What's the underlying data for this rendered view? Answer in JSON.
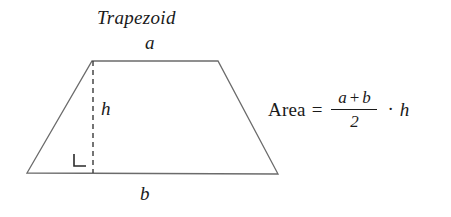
{
  "figure": {
    "title": "Trapezoid",
    "type": "geometry-diagram",
    "background_color": "#ffffff",
    "stroke_color": "#6b6b6b",
    "text_color": "#1a1a1a"
  },
  "shape": {
    "name": "trapezoid",
    "vertices": {
      "bottom_left": [
        27,
        173
      ],
      "top_left": [
        92,
        61
      ],
      "top_right": [
        218,
        61
      ],
      "bottom_right": [
        278,
        174
      ]
    },
    "height_line": {
      "style": "dashed",
      "from": [
        93,
        61
      ],
      "to": [
        93,
        173
      ]
    },
    "right_angle_marker": {
      "present": true,
      "position": [
        74,
        153
      ],
      "size": 12
    }
  },
  "labels": {
    "top_side": "a",
    "bottom_side": "b",
    "height": "h"
  },
  "formula": {
    "area_word": "Area",
    "equals": "=",
    "numerator_left": "a",
    "numerator_operator": "+",
    "numerator_right": "b",
    "denominator": "2",
    "multiply_dot": "·",
    "height_factor": "h",
    "plain_text": "Area = (a + b) / 2 · h"
  }
}
